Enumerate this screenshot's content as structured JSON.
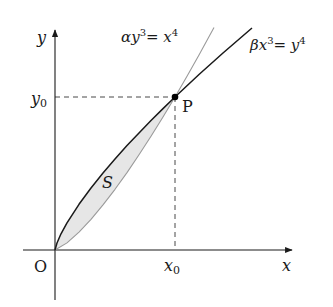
{
  "figure": {
    "type": "area-between-curves",
    "axes": {
      "x_label": "x",
      "y_label": "y",
      "origin_label": "O"
    },
    "point": {
      "label": "P",
      "x_label": "x",
      "x_sub": "0",
      "y_label": "y",
      "y_sub": "0"
    },
    "region_label": "S",
    "curves": [
      {
        "name": "alpha-curve",
        "equation_parts": {
          "coef": "α",
          "var": "y",
          "exp": "3",
          "eq": "= ",
          "rhs_var": "x",
          "rhs_exp": "4"
        },
        "equation_text": "αy³ = x⁴",
        "color": "#9a9a9a"
      },
      {
        "name": "beta-curve",
        "equation_parts": {
          "coef": "β",
          "var": "x",
          "exp": "3",
          "eq": "= ",
          "rhs_var": "y",
          "rhs_exp": "4"
        },
        "equation_text": "βx³ = y⁴",
        "color": "#1a1a1a"
      }
    ],
    "colors": {
      "axis": "#1a1a1a",
      "region_fill": "#e6e6e6",
      "dashed": "#333333"
    }
  }
}
